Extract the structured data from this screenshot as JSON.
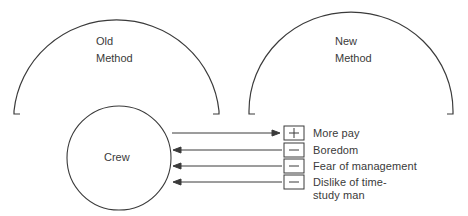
{
  "diagram": {
    "old_method": {
      "line1": "Old",
      "line2": "Method"
    },
    "new_method": {
      "line1": "New",
      "line2": "Method"
    },
    "crew": {
      "label": "Crew"
    },
    "factors": [
      {
        "sign": "+",
        "sign_icon": "plus-icon",
        "direction": "toward-factor",
        "label": "More pay"
      },
      {
        "sign": "−",
        "sign_icon": "minus-icon",
        "direction": "toward-crew",
        "label": "Boredom"
      },
      {
        "sign": "−",
        "sign_icon": "minus-icon",
        "direction": "toward-crew",
        "label": "Fear of management"
      },
      {
        "sign": "−",
        "sign_icon": "minus-icon",
        "direction": "toward-crew",
        "label": "Dislike of time-",
        "label_line2": "study man"
      }
    ],
    "colors": {
      "stroke": "#3a3a3a",
      "background": "#ffffff"
    }
  }
}
